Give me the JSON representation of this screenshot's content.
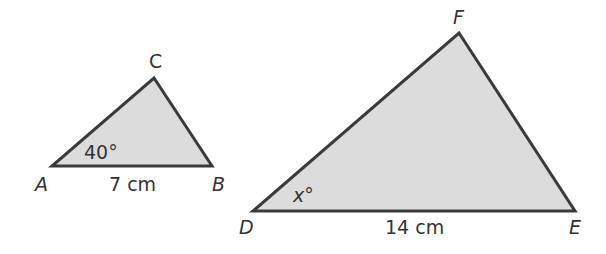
{
  "diagram": {
    "type": "similar-triangles",
    "fill_color": "#dcdcdc",
    "stroke_color": "#3a3a3a",
    "triangle_small": {
      "vertices": {
        "A": "A",
        "B": "B",
        "C": "C"
      },
      "angle_label": "40°",
      "side_label": "7 cm"
    },
    "triangle_large": {
      "vertices": {
        "D": "D",
        "E": "E",
        "F": "F"
      },
      "angle_label": "x°",
      "side_label": "14 cm"
    }
  }
}
